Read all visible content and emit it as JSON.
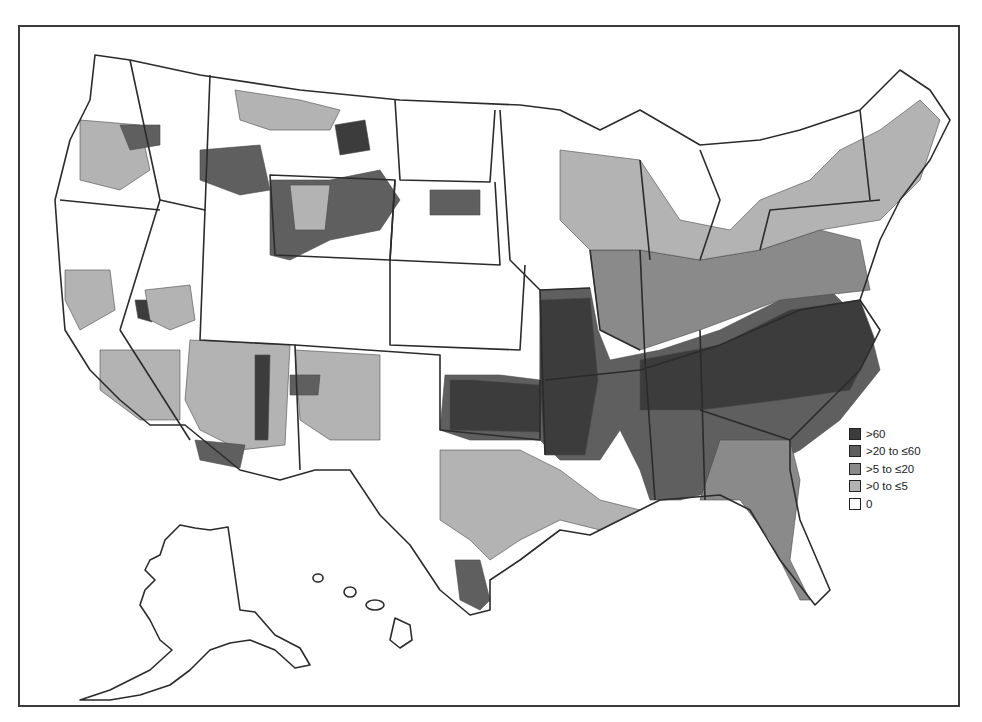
{
  "map": {
    "type": "choropleth",
    "geography": "United States counties",
    "regions_shown": [
      "Contiguous United States",
      "Alaska",
      "Hawaii"
    ]
  },
  "legend": {
    "items": [
      {
        "label": ">60",
        "color": "#3c3c3c"
      },
      {
        "label": ">20 to ≤60",
        "color": "#5f5f5f"
      },
      {
        "label": ">5 to ≤20",
        "color": "#8a8a8a"
      },
      {
        "label": ">0 to ≤5",
        "color": "#b3b3b3"
      },
      {
        "label": "0",
        "color": "#ffffff"
      }
    ]
  },
  "colors": {
    "border": "#2b2b2b",
    "frame": "#3a3a3a",
    "background": "#ffffff"
  }
}
